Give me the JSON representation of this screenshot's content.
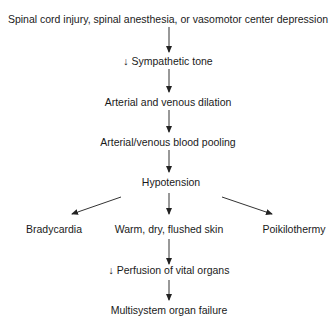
{
  "diagram": {
    "type": "flowchart",
    "nodes": {
      "cause": "Spinal cord injury, spinal anesthesia, or vasomotor center depression",
      "sympathetic": "↓ Sympathetic tone",
      "dilation": "Arterial and venous dilation",
      "pooling": "Arterial/venous blood pooling",
      "hypotension": "Hypotension",
      "bradycardia": "Bradycardia",
      "skin": "Warm, dry, flushed skin",
      "poikilothermy": "Poikilothermy",
      "perfusion": "↓ Perfusion of vital organs",
      "failure": "Multisystem organ failure"
    },
    "edges": [
      {
        "from": "cause",
        "to": "sympathetic"
      },
      {
        "from": "sympathetic",
        "to": "dilation"
      },
      {
        "from": "dilation",
        "to": "pooling"
      },
      {
        "from": "pooling",
        "to": "hypotension"
      },
      {
        "from": "hypotension",
        "to": "bradycardia"
      },
      {
        "from": "hypotension",
        "to": "skin"
      },
      {
        "from": "hypotension",
        "to": "poikilothermy"
      },
      {
        "from": "skin",
        "to": "perfusion"
      },
      {
        "from": "perfusion",
        "to": "failure"
      }
    ],
    "colors": {
      "text": "#1a1a1a",
      "arrow": "#222222",
      "background": "#ffffff"
    }
  }
}
